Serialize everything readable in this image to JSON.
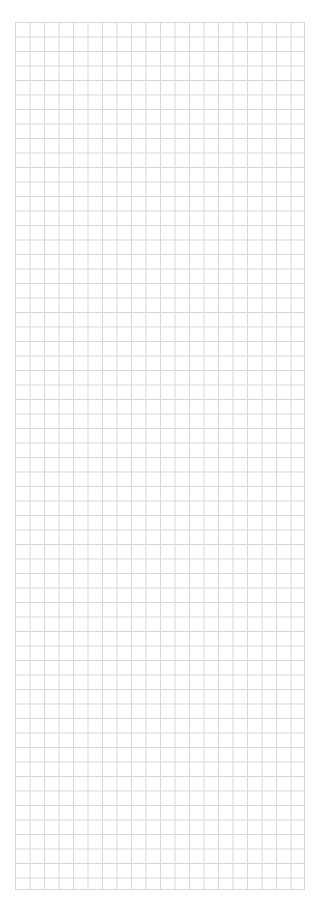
{
  "canvas": {
    "kind": "grid-canvas",
    "content_text": "",
    "background_color": "#ffffff",
    "grid": {
      "line_color": "#d7d7d7",
      "line_width_px": 1,
      "cell_width_px": 14.5,
      "cell_height_px": 14.5,
      "columns": 20,
      "rows": 60,
      "origin_x_px": 15,
      "origin_y_px": 22,
      "width_px": 290,
      "height_px": 868,
      "major_lines": false
    }
  }
}
